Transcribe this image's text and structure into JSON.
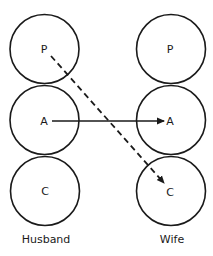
{
  "diagram": {
    "columns": [
      {
        "caption": "Husband",
        "states": [
          {
            "label": "P"
          },
          {
            "label": "A"
          },
          {
            "label": "C"
          }
        ]
      },
      {
        "caption": "Wife",
        "states": [
          {
            "label": "P"
          },
          {
            "label": "A"
          },
          {
            "label": "C"
          }
        ]
      }
    ],
    "transactions": [
      {
        "from": "Husband.A",
        "to": "Wife.A",
        "style": "solid"
      },
      {
        "from": "Husband.P",
        "to": "Wife.C",
        "style": "dashed"
      }
    ],
    "colors": {
      "stroke": "#1a1a1a",
      "background": "#ffffff"
    }
  }
}
